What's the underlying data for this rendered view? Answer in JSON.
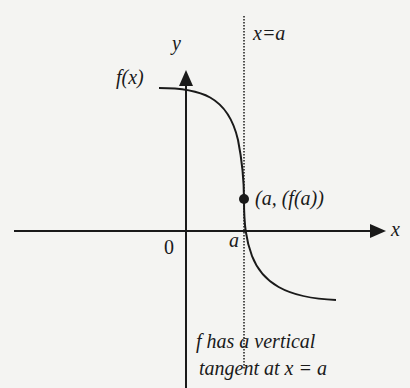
{
  "diagram": {
    "title": "Vertical tangent",
    "axes": {
      "x_label": "x",
      "y_label": "y",
      "origin_label": "0"
    },
    "curve_label": "f(x)",
    "vertical_line_label": "x=a",
    "tick_label_a": "a",
    "point_label": "(a, (f(a))",
    "caption_line1": "f has a vertical",
    "caption_line2": "tangent at x = a",
    "colors": {
      "background": "#f4f4f2",
      "ink": "#1a1a1a"
    }
  }
}
